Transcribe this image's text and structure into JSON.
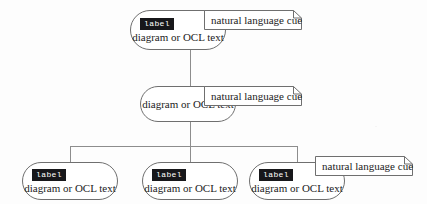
{
  "diagram": {
    "node_label_text": "label",
    "node_body_text": "diagram or OCL text",
    "note_text": "natural language cue",
    "colors": {
      "label_badge_bg": "#17171a",
      "label_badge_fg": "#ffffff",
      "node_border": "#6f6f6f",
      "line": "#8d8d8d",
      "text": "#1c1c1c",
      "background": "#fdfdfd"
    },
    "nodes": [
      {
        "id": "top",
        "label": "label",
        "body": "diagram or OCL text",
        "has_label": true
      },
      {
        "id": "middle",
        "label": "",
        "body": "diagram or OCL text",
        "has_label": false
      },
      {
        "id": "bottom-left",
        "label": "label",
        "body": "diagram or OCL text",
        "has_label": true
      },
      {
        "id": "bottom-center",
        "label": "label",
        "body": "diagram or OCL text",
        "has_label": true
      },
      {
        "id": "bottom-right",
        "label": "label",
        "body": "diagram or OCL text",
        "has_label": true
      }
    ],
    "notes": [
      {
        "id": "note-top",
        "text": "natural language cue",
        "attached_to": "top"
      },
      {
        "id": "note-middle",
        "text": "natural language cue",
        "attached_to": "middle"
      },
      {
        "id": "note-bottom",
        "text": "natural language cue",
        "attached_to": "bottom-right"
      }
    ]
  }
}
